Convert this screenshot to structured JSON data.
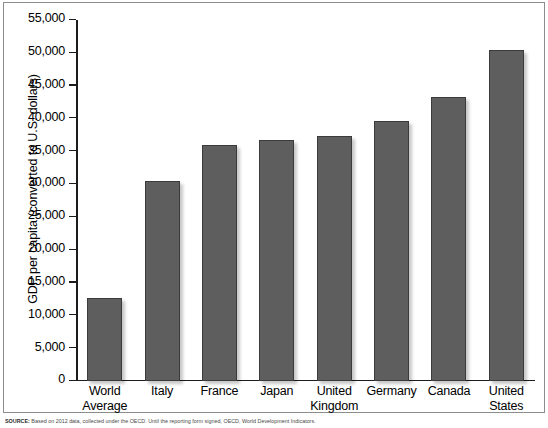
{
  "chart_data": {
    "type": "bar",
    "title": "",
    "xlabel": "",
    "ylabel": "GDP per capita (converted to U.S. dollars)",
    "ylim": [
      0,
      55000
    ],
    "ytick_step": 5000,
    "grid": false,
    "legend": null,
    "bar_color": "#5e5e5e",
    "bar_border_color": "#3b3b3b",
    "categories": [
      "World Average",
      "Italy",
      "France",
      "Japan",
      "United Kingdom",
      "Germany",
      "Canada",
      "United States"
    ],
    "category_lines": [
      [
        "World",
        "Average"
      ],
      [
        "Italy"
      ],
      [
        "France"
      ],
      [
        "Japan"
      ],
      [
        "United",
        "Kingdom"
      ],
      [
        "Germany"
      ],
      [
        "Canada"
      ],
      [
        "United",
        "States"
      ]
    ],
    "values": [
      12700,
      30500,
      36000,
      36700,
      37300,
      39600,
      43200,
      50500
    ],
    "ytick_labels": [
      "0",
      "5,000",
      "10,000",
      "15,000",
      "20,000",
      "25,000",
      "30,000",
      "35,000",
      "40,000",
      "45,000",
      "50,000",
      "55,000"
    ],
    "ytick_values": [
      0,
      5000,
      10000,
      15000,
      20000,
      25000,
      30000,
      35000,
      40000,
      45000,
      50000,
      55000
    ]
  },
  "source": {
    "label": "SOURCE:",
    "text": "Based on 2012 data, collected under the OECD. Until the reporting form signed, OECD, World Development Indicators."
  }
}
